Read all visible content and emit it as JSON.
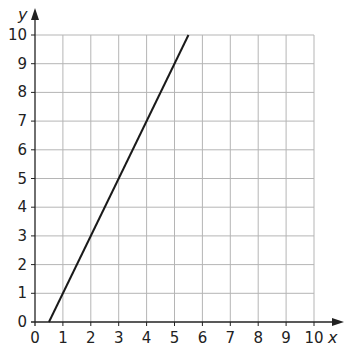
{
  "chart_data": {
    "type": "line",
    "title": "",
    "xlabel": "x",
    "ylabel": "y",
    "xlim": [
      0,
      10
    ],
    "ylim": [
      0,
      10
    ],
    "grid": true,
    "x_ticks": [
      "0",
      "1",
      "2",
      "3",
      "4",
      "5",
      "6",
      "7",
      "8",
      "9",
      "10"
    ],
    "y_ticks": [
      "0",
      "1",
      "2",
      "3",
      "4",
      "5",
      "6",
      "7",
      "8",
      "9",
      "10"
    ],
    "series": [
      {
        "name": "line",
        "equation": "y = 2x - 1",
        "x": [
          0.5,
          5.5
        ],
        "y": [
          0,
          10
        ],
        "color": "#1a1a1a"
      }
    ],
    "legend": null
  },
  "colors": {
    "grid": "#b5b5b5",
    "axis": "#222222",
    "line": "#1a1a1a"
  }
}
